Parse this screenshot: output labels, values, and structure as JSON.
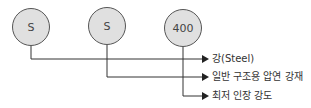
{
  "diagram": {
    "nodes": [
      {
        "id": "n1",
        "text": "S"
      },
      {
        "id": "n2",
        "text": "S"
      },
      {
        "id": "n3",
        "text": "400"
      }
    ],
    "labels": [
      {
        "for": "n1",
        "text": "강(Steel)"
      },
      {
        "for": "n2",
        "text": "일반 구조용 압연 강재"
      },
      {
        "for": "n3",
        "text": "최저 인장 강도"
      }
    ],
    "colors": {
      "circle_fill": "#e0e0e0",
      "line": "#333333"
    }
  }
}
